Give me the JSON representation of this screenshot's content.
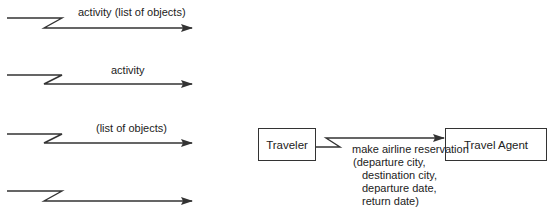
{
  "legend_arrows": [
    {
      "label": "activity (list of objects)"
    },
    {
      "label": "activity"
    },
    {
      "label": "(list of objects)"
    },
    {
      "label": ""
    }
  ],
  "example": {
    "source": "Traveler",
    "target": "Travel Agent",
    "message": "make airline reservation",
    "parameters": [
      "(departure city,",
      "destination city,",
      "departure date,",
      "return date)"
    ]
  },
  "colors": {
    "line": "#333333",
    "text": "#222222",
    "background": "#ffffff"
  }
}
